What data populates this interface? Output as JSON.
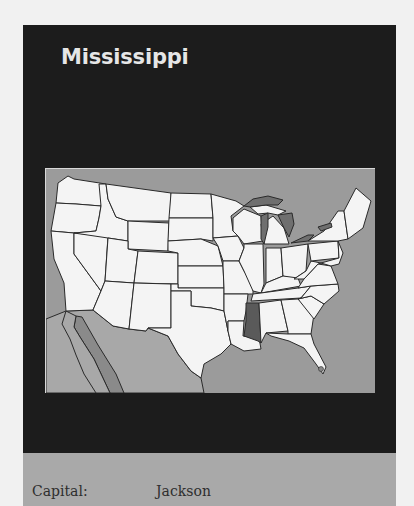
{
  "card": {
    "title": "Mississippi",
    "map": {
      "description": "Map of the contiguous United States with Mississippi highlighted",
      "highlighted_state": "Mississippi",
      "colors": {
        "land": "#f4f4f4",
        "highlight": "#5a5a5a",
        "water": "#9b9b9b",
        "lakes": "#6f6f6f",
        "mexico": "#a8a8a8",
        "gulf_of_california": "#8a8a8a",
        "border": "#2a2a2a"
      },
      "capital_marker_icon": "dot-icon"
    },
    "info": [
      {
        "label": "Capital:",
        "value": "Jackson"
      }
    ]
  }
}
